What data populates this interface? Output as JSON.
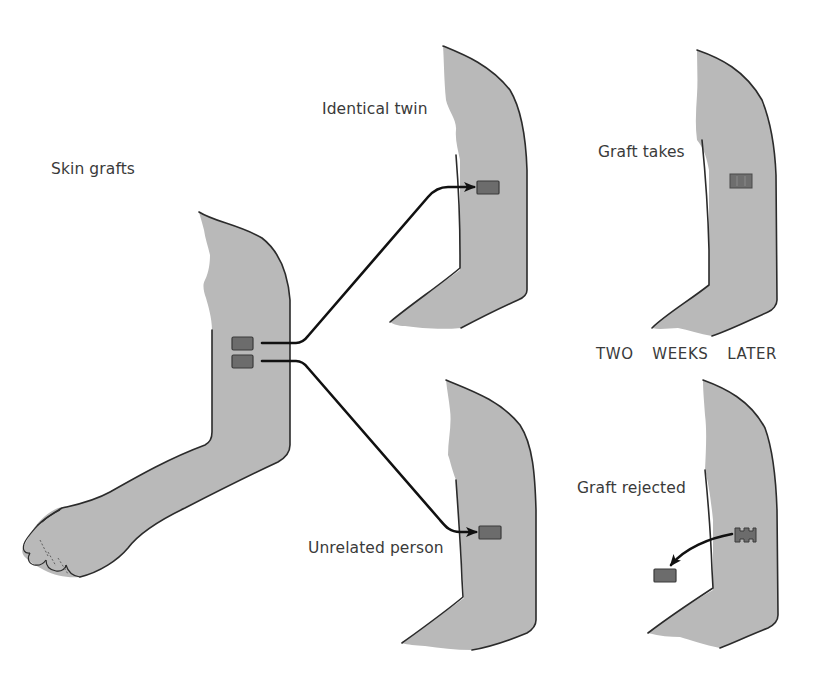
{
  "diagram": {
    "title": "Skin grafts",
    "donor": {
      "label": "Skin grafts",
      "graft_count": 2
    },
    "recipients": [
      {
        "id": "identical-twin",
        "label": "Identical twin",
        "initial_state": "graft applied"
      },
      {
        "id": "unrelated-person",
        "label": "Unrelated person",
        "initial_state": "graft applied"
      }
    ],
    "time_marker": "TWO  WEEKS  LATER",
    "outcomes": [
      {
        "id": "graft-takes",
        "label": "Graft takes",
        "recipient": "identical-twin"
      },
      {
        "id": "graft-rejected",
        "label": "Graft rejected",
        "recipient": "unrelated-person"
      }
    ],
    "colors": {
      "skin": "#b9b9b9",
      "graft": "#6c6c6c",
      "outline": "#2b2b2b",
      "arrow": "#111111",
      "text": "#3a3a3a",
      "background": "#ffffff"
    }
  }
}
